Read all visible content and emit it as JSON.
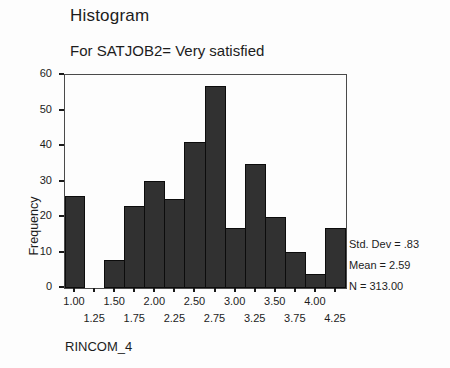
{
  "chart": {
    "title": "Histogram",
    "subtitle": "For SATJOB2= Very satisfied",
    "ylabel": "Frequency",
    "xvar": "RINCOM_4",
    "stats": {
      "std_dev": "Std. Dev = .83",
      "mean": "Mean = 2.59",
      "n": "N = 313.00"
    }
  },
  "chart_data": {
    "type": "bar",
    "title": "Histogram",
    "subtitle": "For SATJOB2= Very satisfied",
    "xlabel": "RINCOM_4",
    "ylabel": "Frequency",
    "categories": [
      "1.00",
      "1.25",
      "1.50",
      "1.75",
      "2.00",
      "2.25",
      "2.50",
      "2.75",
      "3.00",
      "3.25",
      "3.50",
      "3.75",
      "4.00",
      "4.25"
    ],
    "values": [
      26,
      0,
      8,
      23,
      30,
      25,
      41,
      57,
      17,
      35,
      20,
      10,
      4,
      17
    ],
    "ylim": [
      0,
      60
    ],
    "yticks": [
      0,
      10,
      20,
      30,
      40,
      50,
      60
    ],
    "annotations": [
      "Std. Dev = .83",
      "Mean = 2.59",
      "N = 313.00"
    ],
    "bar_color": "#313131",
    "bar_border_color": "#0c0c0c",
    "grid": false,
    "legend": "none",
    "n_total": 313
  }
}
